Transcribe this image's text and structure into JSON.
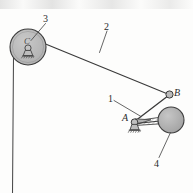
{
  "figure": {
    "kind": "mechanism-kinematic-diagram",
    "width": 193,
    "height": 193,
    "background_color": "#fdfdfc",
    "stroke_color": "#3a3a3a",
    "fill_gray": "#b6b6b6",
    "fill_gray_dark": "#a9a9a9",
    "hatch_gray": "#9e9e9e"
  },
  "labels": {
    "link_1": "1",
    "link_2": "2",
    "pulley_3": "3",
    "disc_4": "4",
    "joint_a": "A",
    "joint_b": "B",
    "pulley_center_c": "C"
  },
  "parts": [
    {
      "id": "1",
      "name": "crank-link-1",
      "label": "1",
      "type": "link"
    },
    {
      "id": "2",
      "name": "cable-link-2",
      "label": "2",
      "type": "cable"
    },
    {
      "id": "3",
      "name": "pulley-3",
      "label": "3",
      "type": "pulley"
    },
    {
      "id": "4",
      "name": "disc-4",
      "label": "4",
      "type": "disc"
    }
  ],
  "joints": [
    {
      "id": "A",
      "name": "pin-support-a",
      "label": "A",
      "x": 134,
      "y": 123,
      "type": "fixed-pin-support"
    },
    {
      "id": "B",
      "name": "pin-joint-b",
      "label": "B",
      "x": 170,
      "y": 95,
      "type": "pin-joint"
    },
    {
      "id": "C",
      "name": "pulley-center-c",
      "label": "C",
      "x": 28,
      "y": 45,
      "type": "fixed-pin-support"
    }
  ],
  "geometry": {
    "pulley": {
      "cx": 28,
      "cy": 47,
      "r": 18
    },
    "disc": {
      "cx": 171,
      "cy": 120,
      "r": 13
    },
    "cable_top": {
      "x1": 37,
      "y1": 41,
      "x2": 168,
      "y2": 94
    },
    "cable_vertical": {
      "x1": 13,
      "y1": 60,
      "x2": 13,
      "y2": 193
    },
    "link_ab": {
      "x1": 134,
      "y1": 122,
      "x2": 168,
      "y2": 95
    },
    "link_a_disc": {
      "x1": 136,
      "y1": 123,
      "x2": 160,
      "y2": 121
    },
    "leader_1": {
      "x1": 114,
      "y1": 101,
      "x2": 140,
      "y2": 116
    },
    "leader_2": {
      "x1": 107,
      "y1": 31,
      "x2": 99,
      "y2": 53
    },
    "leader_3": {
      "x1": 45,
      "y1": 24,
      "x2": 31,
      "y2": 40
    },
    "leader_4": {
      "x1": 159,
      "y1": 159,
      "x2": 171,
      "y2": 132
    }
  },
  "label_positions": {
    "link_1": {
      "x": 109,
      "y": 95
    },
    "link_2": {
      "x": 104,
      "y": 22
    },
    "pulley_3": {
      "x": 43,
      "y": 14
    },
    "disc_4": {
      "x": 155,
      "y": 160
    },
    "joint_a": {
      "x": 123,
      "y": 114
    },
    "joint_b": {
      "x": 175,
      "y": 88
    },
    "pulley_center_c": {
      "x": 24,
      "y": 37
    }
  }
}
